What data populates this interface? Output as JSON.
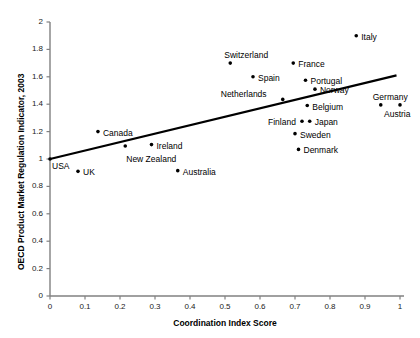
{
  "chart_data": {
    "type": "scatter",
    "title": "",
    "xlabel": "Coordination Index Score",
    "ylabel": "OECD Product Market Regulation Indicator, 2003",
    "xlim": [
      0,
      1
    ],
    "ylim": [
      0,
      2
    ],
    "xticks": [
      "0",
      "0.1",
      "0.2",
      "0.3",
      "0.4",
      "0.5",
      "0.6",
      "0.7",
      "0.8",
      "0.9",
      "1"
    ],
    "xtick_values": [
      0,
      0.1,
      0.2,
      0.3,
      0.4,
      0.5,
      0.6,
      0.7,
      0.8,
      0.9,
      1
    ],
    "yticks": [
      "0",
      "0.2",
      "0.4",
      "0.6",
      "0.8",
      "1",
      "1.2",
      "1.4",
      "1.6",
      "1.8",
      "2"
    ],
    "ytick_values": [
      0,
      0.2,
      0.4,
      0.6,
      0.8,
      1.0,
      1.2,
      1.4,
      1.6,
      1.8,
      2.0
    ],
    "grid": false,
    "legend": "none",
    "marker_color": "#000000",
    "axis_color": "#808080",
    "trendline_color": "#000000",
    "trendline": {
      "label": "fitted-regression-line",
      "x_start": 0.0,
      "y_start": 1.0,
      "x_end": 0.99,
      "y_end": 1.61
    },
    "points": [
      {
        "name": "USA",
        "x": 0.0,
        "y": 1.0,
        "label_dx": 2,
        "label_dy": 9
      },
      {
        "name": "UK",
        "x": 0.08,
        "y": 0.91,
        "label_dx": 5,
        "label_dy": 3
      },
      {
        "name": "Canada",
        "x": 0.137,
        "y": 1.2,
        "label_dx": 5,
        "label_dy": 3
      },
      {
        "name": "New Zealand",
        "x": 0.215,
        "y": 1.095,
        "label_dx": 1,
        "label_dy": 15
      },
      {
        "name": "Ireland",
        "x": 0.29,
        "y": 1.105,
        "label_dx": 5,
        "label_dy": 3
      },
      {
        "name": "Australia",
        "x": 0.365,
        "y": 0.915,
        "label_dx": 5,
        "label_dy": 3
      },
      {
        "name": "Switzerland",
        "x": 0.515,
        "y": 1.7,
        "label_dx": -6,
        "label_dy": -6
      },
      {
        "name": "Spain",
        "x": 0.58,
        "y": 1.6,
        "label_dx": 5,
        "label_dy": 3
      },
      {
        "name": "Netherlands",
        "x": 0.665,
        "y": 1.435,
        "label_dx": -62,
        "label_dy": -3
      },
      {
        "name": "France",
        "x": 0.695,
        "y": 1.7,
        "label_dx": 5,
        "label_dy": 3
      },
      {
        "name": "Portugal",
        "x": 0.73,
        "y": 1.575,
        "label_dx": 5,
        "label_dy": 3
      },
      {
        "name": "Belgium",
        "x": 0.735,
        "y": 1.39,
        "label_dx": 5,
        "label_dy": 3
      },
      {
        "name": "Finland",
        "x": 0.72,
        "y": 1.275,
        "label_dx": -34,
        "label_dy": 3
      },
      {
        "name": "Sweden",
        "x": 0.7,
        "y": 1.185,
        "label_dx": 5,
        "label_dy": 3
      },
      {
        "name": "Denmark",
        "x": 0.71,
        "y": 1.07,
        "label_dx": 5,
        "label_dy": 3
      },
      {
        "name": "Norway",
        "x": 0.757,
        "y": 1.51,
        "label_dx": 5,
        "label_dy": 3
      },
      {
        "name": "Japan",
        "x": 0.742,
        "y": 1.275,
        "label_dx": 5,
        "label_dy": 3
      },
      {
        "name": "Italy",
        "x": 0.875,
        "y": 1.9,
        "label_dx": 5,
        "label_dy": 3
      },
      {
        "name": "Germany",
        "x": 0.945,
        "y": 1.395,
        "label_dx": -8,
        "label_dy": -6
      },
      {
        "name": "Austria",
        "x": 1.0,
        "y": 1.395,
        "label_dx": -16,
        "label_dy": 11
      }
    ]
  }
}
